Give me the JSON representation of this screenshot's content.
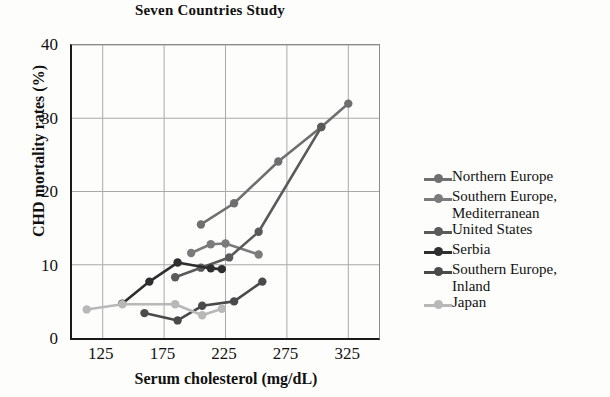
{
  "chart_data": {
    "type": "line",
    "title": "Seven Countries Study",
    "xlabel": "Serum cholesterol (mg/dL)",
    "ylabel": "CHD mortality rates (%)",
    "xlim": [
      100,
      350
    ],
    "ylim": [
      0,
      40
    ],
    "xticks": [
      125,
      175,
      225,
      275,
      325
    ],
    "yticks": [
      0,
      10,
      20,
      30,
      40
    ],
    "grid": true,
    "legend_position": "right",
    "series": [
      {
        "name": "Northern Europe",
        "color": "#6f6f6f",
        "points": [
          {
            "x": 205,
            "y": 15.5
          },
          {
            "x": 232,
            "y": 18.4
          },
          {
            "x": 268,
            "y": 24.1
          },
          {
            "x": 303,
            "y": 28.8
          },
          {
            "x": 325,
            "y": 32.0
          }
        ]
      },
      {
        "name": "Southern Europe,\nMediterranean",
        "color": "#7b7b7b",
        "points": [
          {
            "x": 197,
            "y": 11.6
          },
          {
            "x": 213,
            "y": 12.8
          },
          {
            "x": 225,
            "y": 12.9
          },
          {
            "x": 252,
            "y": 11.4
          }
        ]
      },
      {
        "name": "United States",
        "color": "#5a5a5a",
        "points": [
          {
            "x": 184,
            "y": 8.3
          },
          {
            "x": 205,
            "y": 9.6
          },
          {
            "x": 228,
            "y": 11.0
          },
          {
            "x": 252,
            "y": 14.5
          },
          {
            "x": 303,
            "y": 28.8
          }
        ]
      },
      {
        "name": "Serbia",
        "color": "#2e2e2e",
        "points": [
          {
            "x": 141,
            "y": 4.7
          },
          {
            "x": 163,
            "y": 7.7
          },
          {
            "x": 186,
            "y": 10.3
          },
          {
            "x": 213,
            "y": 9.5
          },
          {
            "x": 222,
            "y": 9.4
          }
        ]
      },
      {
        "name": "Southern Europe,\nInland",
        "color": "#4a4a4a",
        "points": [
          {
            "x": 159,
            "y": 3.4
          },
          {
            "x": 186,
            "y": 2.4
          },
          {
            "x": 206,
            "y": 4.4
          },
          {
            "x": 232,
            "y": 5.0
          },
          {
            "x": 255,
            "y": 7.7
          }
        ]
      },
      {
        "name": "Japan",
        "color": "#b8b8b8",
        "points": [
          {
            "x": 112,
            "y": 3.9
          },
          {
            "x": 141,
            "y": 4.6
          },
          {
            "x": 184,
            "y": 4.6
          },
          {
            "x": 206,
            "y": 3.1
          },
          {
            "x": 222,
            "y": 4.0
          }
        ]
      }
    ]
  },
  "legend": {
    "items": [
      {
        "label": "Northern Europe",
        "color": "#6f6f6f"
      },
      {
        "label": "Southern Europe,\nMediterranean",
        "color": "#7b7b7b"
      },
      {
        "label": "United States",
        "color": "#5a5a5a"
      },
      {
        "label": "Serbia",
        "color": "#2e2e2e"
      },
      {
        "label": "Southern Europe,\nInland",
        "color": "#4a4a4a"
      },
      {
        "label": "Japan",
        "color": "#b8b8b8"
      }
    ]
  },
  "axes": {
    "grid_color": "#a9a9a9",
    "frame_color": "#1a1a1a"
  }
}
